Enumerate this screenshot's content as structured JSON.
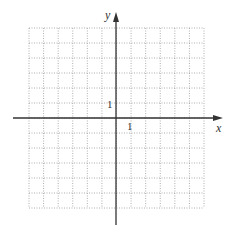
{
  "diagram": {
    "type": "coordinate-grid",
    "x_axis_label": "x",
    "y_axis_label": "y",
    "x_tick_label": "1",
    "y_tick_label": "1",
    "grid": {
      "columns": 12,
      "rows": 12,
      "x_range": [
        -6,
        6
      ],
      "y_range": [
        -6,
        6
      ],
      "line_style": "dotted"
    },
    "colors": {
      "grid": "#9a9a9a",
      "axis": "#333333",
      "background": "#ffffff"
    }
  }
}
